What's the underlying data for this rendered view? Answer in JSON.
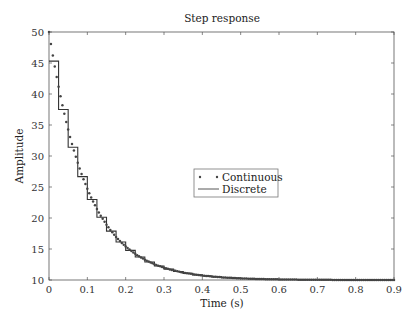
{
  "chart_data": {
    "type": "line",
    "title": "Step response",
    "xlabel": "Time (s)",
    "ylabel": "Amplitude",
    "xlim": [
      0,
      0.9
    ],
    "ylim": [
      10,
      50
    ],
    "xticks": [
      0,
      0.1,
      0.2,
      0.3,
      0.4,
      0.5,
      0.6,
      0.7,
      0.8,
      0.9
    ],
    "xtick_labels": [
      "0",
      "0.1",
      "0.2",
      "0.3",
      "0.4",
      "0.5",
      "0.6",
      "0.7",
      "0.8",
      "0.9"
    ],
    "yticks": [
      10,
      15,
      20,
      25,
      30,
      35,
      40,
      45,
      50
    ],
    "ytick_labels": [
      "10",
      "15",
      "20",
      "25",
      "30",
      "35",
      "40",
      "45",
      "50"
    ],
    "grid": false,
    "legend": {
      "position": "center",
      "entries": [
        "Continuous",
        "Discrete"
      ]
    },
    "series": [
      {
        "name": "Continuous",
        "style": "dots",
        "x_start": 0,
        "x_step": 0.01,
        "values": [
          50.0,
          46.19,
          42.75,
          39.63,
          36.81,
          34.26,
          31.95,
          29.86,
          27.97,
          26.26,
          24.72,
          23.31,
          22.05,
          20.9,
          19.86,
          18.93,
          18.08,
          17.31,
          16.61,
          15.98,
          15.41,
          14.9,
          14.43,
          14.01,
          13.63,
          13.28,
          12.97,
          12.69,
          12.43,
          12.2,
          11.99,
          11.8,
          11.63,
          11.48,
          11.33,
          11.21,
          11.09,
          10.99,
          10.89,
          10.81,
          10.73,
          10.66,
          10.6,
          10.54,
          10.49,
          10.44,
          10.4,
          10.36,
          10.33,
          10.3,
          10.27,
          10.24,
          10.22,
          10.2,
          10.18,
          10.16,
          10.15,
          10.13,
          10.12,
          10.11,
          10.1,
          10.09,
          10.08,
          10.07,
          10.07,
          10.06,
          10.05,
          10.05,
          10.04,
          10.04,
          10.04,
          10.03,
          10.03,
          10.03,
          10.02,
          10.02,
          10.02,
          10.02,
          10.02,
          10.01,
          10.01,
          10.01,
          10.01,
          10.01,
          10.01,
          10.01,
          10.01,
          10.01,
          10.01,
          10.01,
          10.0
        ]
      },
      {
        "name": "Discrete",
        "style": "stairs",
        "x_start": 0,
        "x_step": 0.025,
        "values": [
          45.3,
          37.49,
          31.41,
          26.68,
          22.99,
          20.11,
          17.88,
          16.13,
          14.78,
          13.72,
          12.9,
          12.26,
          11.76,
          11.37,
          11.07,
          10.83,
          10.65,
          10.5,
          10.39,
          10.31,
          10.24,
          10.18,
          10.14,
          10.11,
          10.09,
          10.07,
          10.05,
          10.04,
          10.03,
          10.03,
          10.02,
          10.02,
          10.01,
          10.01,
          10.01,
          10.0
        ]
      }
    ]
  },
  "colors": {
    "continuous": "#444444",
    "discrete": "#333333",
    "axis": "#555555"
  }
}
